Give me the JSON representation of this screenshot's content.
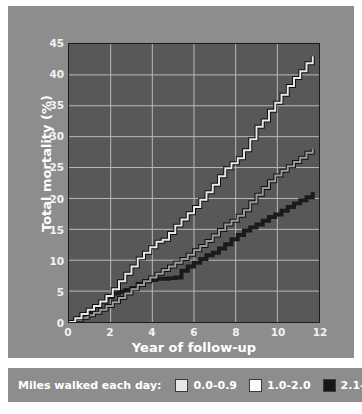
{
  "chart_data": {
    "type": "line",
    "title": "",
    "xlabel": "Year of follow-up",
    "ylabel": "Total mortality (%)",
    "xlim": [
      0,
      12
    ],
    "ylim": [
      0,
      45
    ],
    "xticks": [
      0,
      2,
      4,
      6,
      8,
      10,
      12
    ],
    "yticks": [
      0,
      5,
      10,
      15,
      20,
      25,
      30,
      35,
      40,
      45
    ],
    "grid": true,
    "legend_position": "below",
    "legend_title": "Miles walked each day:",
    "series": [
      {
        "name": "0.0-0.9",
        "color": "#e8e8e8",
        "outline": "#111111",
        "x": [
          0.0,
          0.3,
          0.6,
          0.9,
          1.2,
          1.5,
          1.8,
          2.1,
          2.4,
          2.7,
          3.0,
          3.3,
          3.6,
          3.9,
          4.2,
          4.5,
          4.8,
          5.1,
          5.4,
          5.7,
          6.0,
          6.3,
          6.6,
          6.9,
          7.2,
          7.5,
          7.8,
          8.1,
          8.4,
          8.7,
          9.0,
          9.3,
          9.6,
          9.9,
          10.2,
          10.5,
          10.8,
          11.1,
          11.4,
          11.7
        ],
        "y": [
          0.0,
          0.6,
          1.3,
          2.0,
          2.6,
          3.3,
          4.2,
          5.3,
          6.6,
          7.8,
          9.0,
          10.3,
          11.2,
          12.1,
          13.0,
          13.3,
          14.4,
          15.6,
          16.6,
          17.6,
          18.6,
          19.8,
          21.0,
          22.2,
          23.6,
          24.9,
          25.7,
          26.5,
          27.8,
          29.6,
          31.6,
          32.6,
          34.2,
          35.5,
          36.8,
          38.2,
          39.5,
          40.6,
          41.9,
          43.0
        ]
      },
      {
        "name": "1.0-2.0",
        "color": "#9a9a9a",
        "outline": "#111111",
        "x": [
          0.0,
          0.3,
          0.6,
          0.9,
          1.2,
          1.5,
          1.8,
          2.1,
          2.4,
          2.7,
          3.0,
          3.3,
          3.6,
          3.9,
          4.2,
          4.5,
          4.8,
          5.1,
          5.4,
          5.7,
          6.0,
          6.3,
          6.6,
          6.9,
          7.2,
          7.5,
          7.8,
          8.1,
          8.4,
          8.7,
          9.0,
          9.3,
          9.6,
          9.9,
          10.2,
          10.5,
          10.8,
          11.1,
          11.4,
          11.7
        ],
        "y": [
          0.0,
          0.3,
          0.7,
          1.1,
          1.5,
          2.0,
          2.6,
          3.2,
          3.9,
          4.6,
          5.3,
          6.0,
          6.6,
          7.2,
          7.8,
          8.4,
          9.0,
          9.6,
          10.2,
          10.9,
          11.6,
          12.3,
          13.1,
          14.0,
          14.9,
          15.8,
          16.4,
          17.2,
          18.1,
          19.4,
          20.6,
          21.7,
          22.8,
          23.7,
          24.5,
          25.2,
          25.9,
          26.6,
          27.4,
          28.0
        ]
      },
      {
        "name": "2.1-8.0",
        "color": "#1b1b1b",
        "outline": "#1b1b1b",
        "x": [
          0.0,
          0.3,
          0.6,
          0.9,
          1.2,
          1.5,
          1.8,
          2.1,
          2.4,
          2.7,
          3.0,
          3.3,
          3.6,
          3.9,
          4.2,
          4.5,
          4.8,
          5.1,
          5.4,
          5.7,
          6.0,
          6.3,
          6.6,
          6.9,
          7.2,
          7.5,
          7.8,
          8.1,
          8.4,
          8.7,
          9.0,
          9.3,
          9.6,
          9.9,
          10.2,
          10.5,
          10.8,
          11.1,
          11.4,
          11.7
        ],
        "y": [
          0.0,
          0.5,
          1.1,
          1.7,
          2.5,
          3.3,
          4.0,
          4.6,
          4.9,
          5.2,
          5.5,
          6.2,
          6.6,
          6.8,
          7.0,
          7.0,
          7.1,
          7.2,
          8.3,
          9.0,
          9.6,
          10.2,
          10.8,
          11.2,
          11.9,
          12.6,
          13.4,
          14.1,
          14.8,
          15.3,
          15.8,
          16.4,
          17.0,
          17.4,
          18.0,
          18.6,
          19.2,
          19.7,
          20.2,
          21.0
        ]
      }
    ]
  },
  "axes": {
    "y_title": "Total mortality (%)",
    "x_title": "Year of follow-up",
    "y_tick_labels": [
      "45",
      "40",
      "35",
      "30",
      "25",
      "20",
      "15",
      "10",
      "5",
      "0"
    ],
    "x_tick_labels": [
      "0",
      "2",
      "4",
      "6",
      "8",
      "10",
      "12"
    ]
  },
  "legend": {
    "title": "Miles walked each day:",
    "items": [
      {
        "label": "0.0-0.9",
        "color": "#e8e8e8"
      },
      {
        "label": "1.0-2.0",
        "color": "#fcfcfc"
      },
      {
        "label": "2.1-8.0",
        "color": "#161616"
      }
    ]
  },
  "colors": {
    "panel_background": "#8d8d8d",
    "plot_background": "#585858",
    "gridline": "#b9b9b9",
    "axis": "#1b1b1b",
    "text": "#ffffff"
  }
}
